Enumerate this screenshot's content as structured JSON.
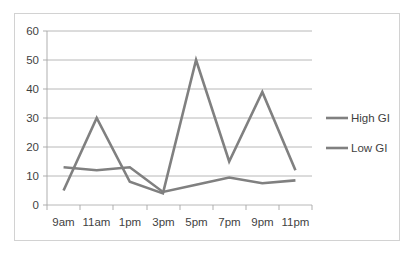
{
  "chart_data": {
    "type": "line",
    "title": "",
    "subtitle": "",
    "xlabel": "",
    "ylabel": "",
    "categories": [
      "9am",
      "11am",
      "1pm",
      "3pm",
      "5pm",
      "7pm",
      "9pm",
      "11pm"
    ],
    "ylim": [
      0,
      60
    ],
    "yticks": [
      0,
      10,
      20,
      30,
      40,
      50,
      60
    ],
    "ytick_labels": [
      "0",
      "10",
      "20",
      "30",
      "40",
      "50",
      "60"
    ],
    "grid": true,
    "legend_position": "right",
    "series": [
      {
        "name": "High GI",
        "color": "#808080",
        "values": [
          5,
          30,
          8,
          4,
          50,
          15,
          39,
          12
        ]
      },
      {
        "name": "Low GI",
        "color": "#808080",
        "values": [
          13,
          12,
          13,
          4.5,
          7,
          9.5,
          7.5,
          8.5
        ]
      }
    ]
  },
  "axes": {
    "y_tick_labels": [
      "60",
      "50",
      "40",
      "30",
      "20",
      "10",
      "0"
    ],
    "x_tick_labels": [
      "9am",
      "11am",
      "1pm",
      "3pm",
      "5pm",
      "7pm",
      "9pm",
      "11pm"
    ]
  },
  "legend": {
    "entries": [
      {
        "label": "High GI",
        "color": "#808080"
      },
      {
        "label": "Low GI",
        "color": "#808080"
      }
    ]
  },
  "style": {
    "plot_background": "#ffffff",
    "frame_border": "#d2d2d2",
    "grid_color": "#a6a6a6",
    "axis_color": "#a6a6a6",
    "text_color": "#3f3f3f",
    "series_color": "#808080"
  }
}
